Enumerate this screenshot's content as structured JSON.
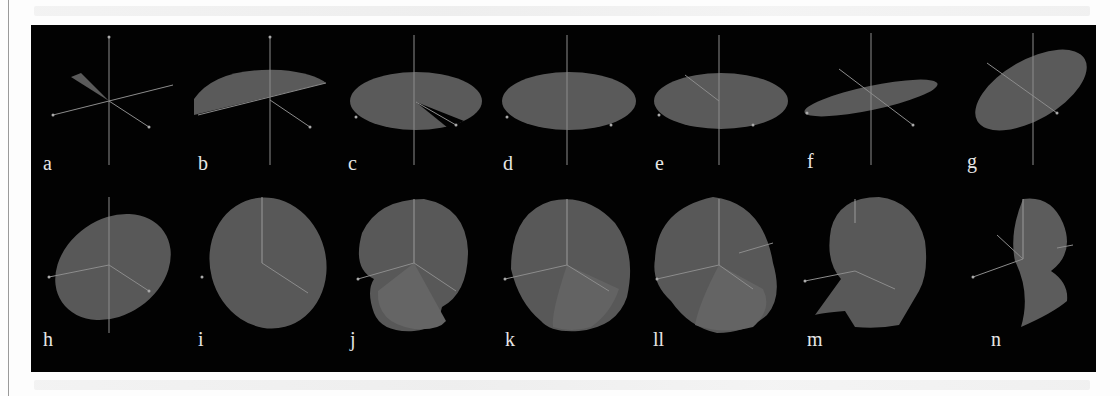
{
  "figure": {
    "background": "#020202",
    "surface_color": "#5a5a5a",
    "axis_color": "#8c8c8c",
    "label_color": "#e6e6e6",
    "rows": [
      {
        "panels": [
          {
            "label": "a",
            "shape": "thin wedge sector"
          },
          {
            "label": "b",
            "shape": "half disc"
          },
          {
            "label": "c",
            "shape": "disc with missing wedge"
          },
          {
            "label": "d",
            "shape": "full disc"
          },
          {
            "label": "e",
            "shape": "full disc (rotated view)"
          },
          {
            "label": "f",
            "shape": "tilted thin disc"
          },
          {
            "label": "g",
            "shape": "tilted ellipse"
          }
        ]
      },
      {
        "panels": [
          {
            "label": "h",
            "shape": "tilted ellipsoid"
          },
          {
            "label": "i",
            "shape": "ellipsoid"
          },
          {
            "label": "j",
            "shape": "sphere with wedge section"
          },
          {
            "label": "k",
            "shape": "rounded body with fold"
          },
          {
            "label": "ll",
            "shape": "sphere with cut"
          },
          {
            "label": "m",
            "shape": "sphere with lower flare"
          },
          {
            "label": "n",
            "shape": "lobed surface"
          }
        ]
      }
    ]
  }
}
